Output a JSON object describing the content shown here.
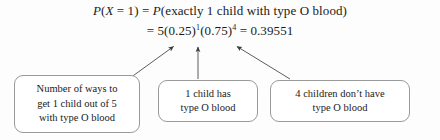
{
  "figure": {
    "background_color": "#fdfdfd",
    "line_color": "#4a4a4a",
    "box_border_color": "#9a9a9a",
    "text_color": "#1a1a1a"
  },
  "equation": {
    "line1": {
      "p1": "P",
      "open1": "(",
      "variable": "X",
      "equals1": " = 1",
      "close1": ")",
      "equals2": " = ",
      "p2": "P",
      "open2": "(",
      "phrase": "exactly 1 child with type O blood",
      "close2": ")",
      "full_text": "P(X = 1) = P(exactly 1 child with type O blood)"
    },
    "line2": {
      "equals_lead": "= ",
      "coefficient": "5",
      "base1": "(0.25)",
      "exp1": "1",
      "base2": "(0.75)",
      "exp2": "4",
      "equals_tail": " = ",
      "result": "0.39551",
      "full_text": "= 5(0.25)1(0.75)4 = 0.39551"
    }
  },
  "callouts": [
    {
      "id": "ways",
      "lines": [
        "Number of ways to",
        "get 1 child out of 5",
        "with type O blood"
      ],
      "points_to": "coefficient 5"
    },
    {
      "id": "one-child",
      "lines": [
        "1 child has",
        "type O blood"
      ],
      "points_to": "(0.25) to the 1"
    },
    {
      "id": "four-children",
      "lines": [
        "4 children don’t have",
        "type O blood"
      ],
      "points_to": "(0.75) to the 4"
    }
  ],
  "arrows": [
    {
      "id": "arrow-to-coefficient",
      "from": [
        130,
        78
      ],
      "to": [
        172,
        45
      ],
      "direction": "up-right"
    },
    {
      "id": "arrow-to-first-factor",
      "from": [
        198,
        79
      ],
      "to": [
        198,
        45
      ],
      "direction": "up"
    },
    {
      "id": "arrow-to-second-factor",
      "from": [
        290,
        79
      ],
      "to": [
        236,
        45
      ],
      "direction": "up-left"
    }
  ]
}
